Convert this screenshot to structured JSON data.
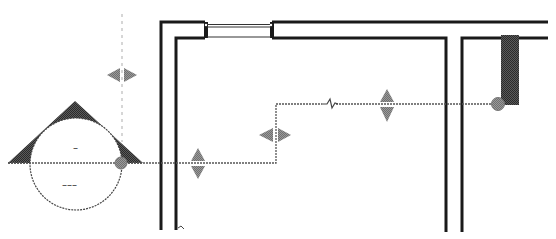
{
  "diagram": {
    "type": "floor-plan-piping-cad",
    "colors": {
      "background": "#ffffff",
      "wall": "#1a1a1a",
      "pipe": "#555555",
      "grip": "#7a7a7a",
      "fill_dark": "#3a3a3a",
      "guide": "#bbbbbb",
      "node": "#a8a8a8"
    },
    "fixture": {
      "label_top": "–",
      "label_bottom": "–––",
      "shape": "circle-with-triangle-cap"
    },
    "pipe_break_symbol": "zigzag",
    "grips": [
      {
        "name": "horizontal-grip-guide",
        "orientation": "horizontal",
        "x": 122,
        "y": 75
      },
      {
        "name": "vertical-grip-left",
        "orientation": "vertical",
        "x": 198,
        "y": 169
      },
      {
        "name": "horizontal-grip-mid",
        "orientation": "horizontal",
        "x": 275,
        "y": 135
      },
      {
        "name": "vertical-grip-right",
        "orientation": "vertical",
        "x": 387,
        "y": 106
      }
    ],
    "nodes": [
      {
        "name": "pipe-node-left",
        "x": 121,
        "y": 163
      },
      {
        "name": "pipe-node-right",
        "x": 498,
        "y": 104
      }
    ]
  }
}
